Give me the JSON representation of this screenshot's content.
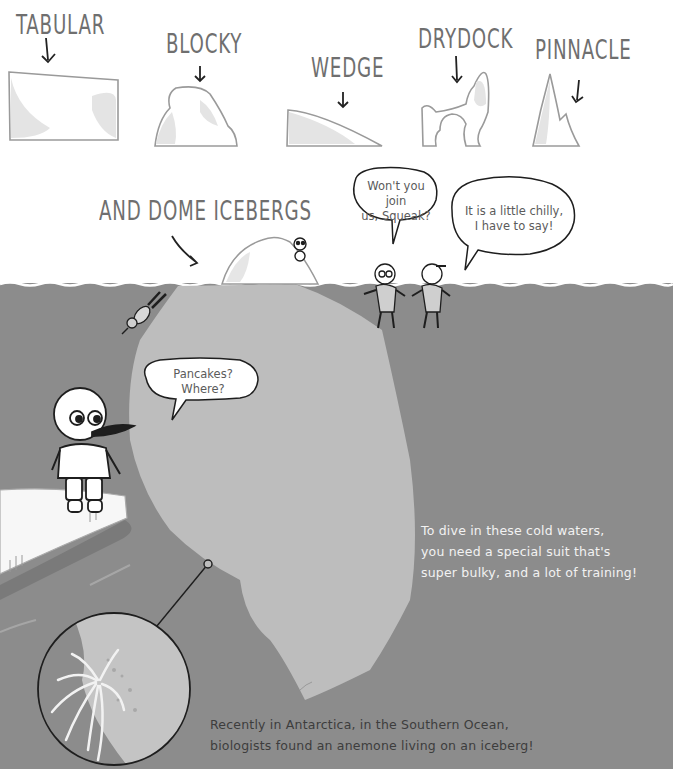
{
  "iceberg_types": [
    {
      "label": "TABULAR"
    },
    {
      "label": "BLOCKY"
    },
    {
      "label": "WEDGE"
    },
    {
      "label": "DRYDOCK"
    },
    {
      "label": "PINNACLE"
    }
  ],
  "dome_label": "AND DOME ICEBERGS",
  "speech_bubbles": {
    "squeak_invite": {
      "line1": "Won't you join",
      "line2": "us, Squeak?"
    },
    "chilly": {
      "line1": "It is a little chilly,",
      "line2": "I have to say!"
    },
    "pancakes": {
      "line1": "Pancakes?",
      "line2": "Where?"
    }
  },
  "captions": {
    "diving": {
      "line1": "To dive in these cold waters,",
      "line2": "you need a special suit that's",
      "line3": "super bulky, and a lot of training!"
    },
    "anemone": {
      "line1": "Recently in Antarctica, in the Southern Ocean,",
      "line2": "biologists found an anemone living on an iceberg!"
    }
  },
  "colors": {
    "water": "#8c8c8c",
    "iceberg_underwater": "#bdbdbd",
    "ice_shading": "#e6e6e6",
    "outline": "#9a9a9a",
    "ink": "#1e1e1e"
  }
}
